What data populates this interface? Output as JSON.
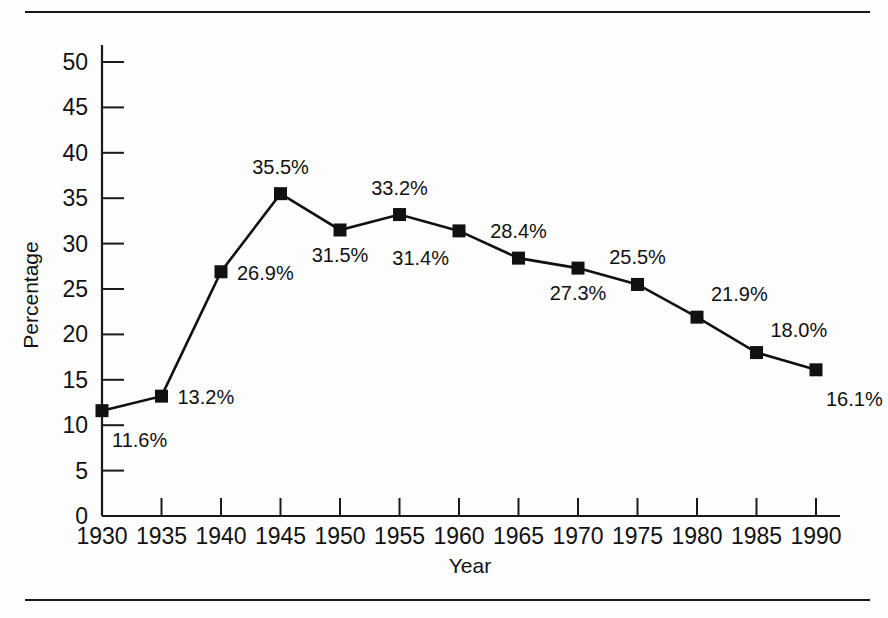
{
  "chart_data": {
    "type": "line",
    "title": "",
    "xlabel": "Year",
    "ylabel": "Percentage",
    "categories": [
      1930,
      1935,
      1940,
      1945,
      1950,
      1955,
      1960,
      1965,
      1970,
      1975,
      1980,
      1985,
      1990
    ],
    "x_tick_labels": [
      "1930",
      "1935",
      "1940",
      "1945",
      "1950",
      "1955",
      "1960",
      "1965",
      "1970",
      "1975",
      "1980",
      "1985",
      "1990"
    ],
    "values": [
      11.6,
      13.2,
      26.9,
      35.5,
      31.5,
      33.2,
      31.4,
      28.4,
      27.3,
      25.5,
      21.9,
      18.0,
      16.1
    ],
    "point_labels": [
      "11.6%",
      "13.2%",
      "26.9%",
      "35.5%",
      "31.5%",
      "33.2%",
      "31.4%",
      "28.4%",
      "27.3%",
      "25.5%",
      "21.9%",
      "18.0%",
      "16.1%"
    ],
    "label_positions": [
      "below-right",
      "right",
      "right",
      "above",
      "below",
      "above",
      "below-left",
      "above",
      "below",
      "above",
      "above-right",
      "above-right",
      "below-right"
    ],
    "ylim": [
      0,
      50
    ],
    "y_tick_labels": [
      "0",
      "5",
      "10",
      "15",
      "20",
      "25",
      "30",
      "35",
      "40",
      "45",
      "50"
    ],
    "y_ticks": [
      0,
      5,
      10,
      15,
      20,
      25,
      30,
      35,
      40,
      45,
      50
    ],
    "xlim": [
      1930,
      1990
    ],
    "grid": false,
    "legend": null,
    "marker": "square",
    "line_color": "#111111",
    "marker_color": "#111111"
  },
  "figure": {
    "top_rule": "horizontal-rule",
    "bottom_rule": "horizontal-rule"
  }
}
